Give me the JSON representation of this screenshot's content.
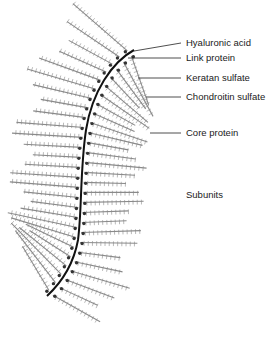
{
  "figure": {
    "labels": [
      {
        "id": "hyaluronic-acid",
        "text": "Hyaluronic acid",
        "x": 186,
        "y": 38,
        "line": [
          134,
          51,
          181,
          43
        ]
      },
      {
        "id": "link-protein",
        "text": "Link protein",
        "x": 186,
        "y": 53,
        "line": [
          128,
          58,
          181,
          58
        ]
      },
      {
        "id": "keratan-sulfate",
        "text": "Keratan sulfate",
        "x": 186,
        "y": 73,
        "line": [
          138,
          78,
          181,
          78
        ]
      },
      {
        "id": "chondroitin-sulfate",
        "text": "Chondroitin sulfate",
        "x": 186,
        "y": 92,
        "line": [
          146,
          97,
          181,
          97
        ]
      },
      {
        "id": "core-protein",
        "text": "Core protein",
        "x": 186,
        "y": 128,
        "line": [
          150,
          133,
          181,
          133
        ]
      },
      {
        "id": "subunits",
        "text": "Subunits",
        "x": 186,
        "y": 190,
        "line": null
      }
    ],
    "colors": {
      "backbone": "#111111",
      "link_dot": "#333333",
      "subunit": "#8a8a8a",
      "leader": "#222222",
      "text": "#1a1a1a"
    }
  }
}
